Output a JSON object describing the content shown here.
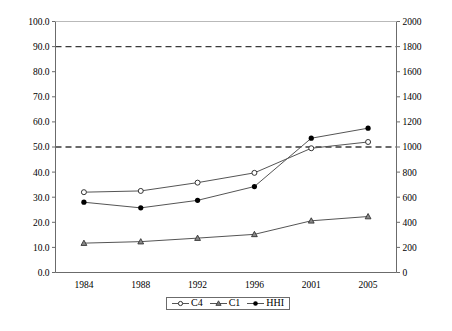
{
  "chart_data": {
    "type": "line",
    "title": "",
    "xlabel": "",
    "ylabel": "",
    "categories": [
      "1984",
      "1988",
      "1992",
      "1996",
      "2001",
      "2005"
    ],
    "left_axis": {
      "label": "",
      "ylim": [
        0.0,
        100.0
      ],
      "tick_step": 10.0,
      "ticks": [
        "0.0",
        "10.0",
        "20.0",
        "30.0",
        "40.0",
        "50.0",
        "60.0",
        "70.0",
        "80.0",
        "90.0",
        "100.0"
      ]
    },
    "right_axis": {
      "label": "",
      "ylim": [
        0,
        2000
      ],
      "tick_step": 200,
      "ticks": [
        "0",
        "200",
        "400",
        "600",
        "800",
        "1000",
        "1200",
        "1400",
        "1600",
        "1800",
        "2000"
      ]
    },
    "grid": false,
    "legend_position": "bottom-center",
    "reference_lines": [
      {
        "name": "upper-threshold",
        "left_value": 90.0,
        "right_value": 1800,
        "style": "dashed"
      },
      {
        "name": "lower-threshold",
        "left_value": 50.0,
        "right_value": 1000,
        "style": "dashed"
      }
    ],
    "series": [
      {
        "name": "C4",
        "axis": "left",
        "marker": "open-circle",
        "values": [
          32.0,
          32.5,
          35.8,
          39.7,
          49.5,
          52.0
        ]
      },
      {
        "name": "C1",
        "axis": "left",
        "marker": "triangle",
        "values": [
          11.7,
          12.3,
          13.7,
          15.2,
          20.6,
          22.3
        ]
      },
      {
        "name": "HHI",
        "axis": "right",
        "marker": "filled-circle",
        "values": [
          560,
          515,
          575,
          685,
          1070,
          1150
        ]
      }
    ],
    "colors": {
      "line": "#555555",
      "marker_fill": "#000000",
      "axis": "#6b6b6b",
      "reference_line": "#3a3a3a"
    }
  },
  "legend": {
    "items": [
      {
        "label": "C4"
      },
      {
        "label": "C1"
      },
      {
        "label": "HHI"
      }
    ]
  }
}
